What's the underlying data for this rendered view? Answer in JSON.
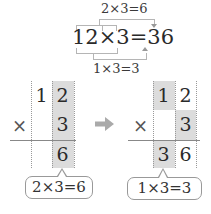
{
  "top_equation": {
    "upper_label": "2×3=6",
    "main": "12×3=36",
    "lower_label": "1×3=3"
  },
  "left_grid": {
    "row1": [
      "",
      "1",
      "2"
    ],
    "row2_sign": "×",
    "row2": [
      "",
      "",
      "3"
    ],
    "row3": [
      "",
      "",
      "6"
    ],
    "highlight": "ones column",
    "callout": "2×3=6"
  },
  "arrow": {
    "icon": "right-arrow-icon",
    "color": "#aaaaaa"
  },
  "right_grid": {
    "row1": [
      "1",
      "2"
    ],
    "row2_sign": "×",
    "row2": [
      "",
      "3"
    ],
    "row3": [
      "3",
      "6"
    ],
    "callout": "1×3=3"
  },
  "colors": {
    "highlight": "#dcdcdc",
    "bracket": "#b5b5b5",
    "text": "#2a2a2a"
  }
}
